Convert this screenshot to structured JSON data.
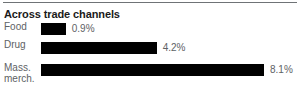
{
  "header": {
    "title": "Across trade channels"
  },
  "chart_data": {
    "type": "bar",
    "orientation": "horizontal",
    "title": "Across trade channels",
    "xlabel": "",
    "ylabel": "",
    "categories": [
      "Food",
      "Mass.\nmerch.",
      "Drug"
    ],
    "rows": [
      {
        "category": "Food",
        "value": 0.9,
        "value_label": "0.9%"
      },
      {
        "category": "Drug",
        "value": 4.2,
        "value_label": "4.2%"
      },
      {
        "category": "Mass.\nmerch.",
        "value": 8.1,
        "value_label": "8.1%"
      }
    ],
    "values": [
      0.9,
      4.2,
      8.1
    ],
    "xlim": [
      0,
      8.1
    ],
    "grid": false,
    "legend": false,
    "bar_color": "#000000",
    "label_color": "#5e6265",
    "title_color": "#1a1a1a",
    "rule_color": "#6f7376"
  }
}
